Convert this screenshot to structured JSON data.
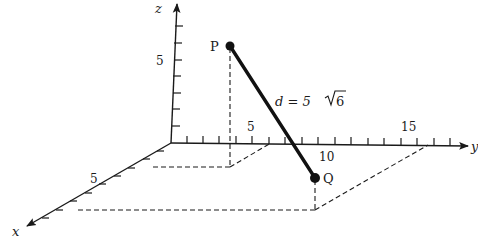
{
  "figure": {
    "axes": {
      "x": {
        "label": "x",
        "tick_labels": [
          "5"
        ]
      },
      "y": {
        "label": "y",
        "tick_labels": [
          "5",
          "10",
          "15"
        ]
      },
      "z": {
        "label": "z",
        "tick_labels": [
          "5"
        ]
      }
    },
    "points": {
      "P": {
        "label": "P"
      },
      "Q": {
        "label": "Q"
      }
    },
    "distance_label": {
      "prefix": "d = 5",
      "radical": "6"
    },
    "colors": {
      "ink": "#1a1a1a",
      "background": "#ffffff"
    }
  }
}
